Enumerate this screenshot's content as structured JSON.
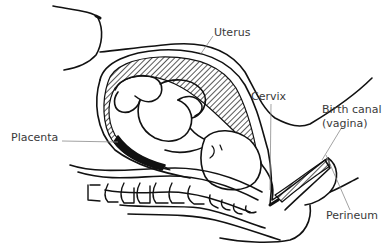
{
  "diagram": {
    "colors": {
      "line": "#111111",
      "leader": "#8a8a8a",
      "text": "#3a3a3a",
      "background": "#ffffff"
    },
    "labels": [
      {
        "id": "uterus",
        "text": "Uterus"
      },
      {
        "id": "cervix",
        "text": "Cervix"
      },
      {
        "id": "birth_canal",
        "text": "Birth canal"
      },
      {
        "id": "birth_canal_sub",
        "text": "(vagina)"
      },
      {
        "id": "placenta",
        "text": "Placenta"
      },
      {
        "id": "perineum",
        "text": "Perineum"
      }
    ]
  }
}
